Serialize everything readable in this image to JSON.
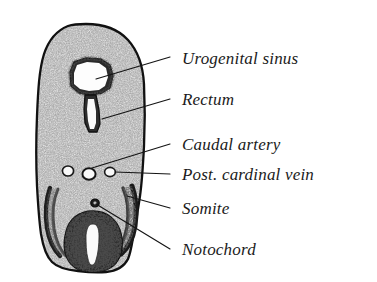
{
  "figure": {
    "kind": "anatomical-cross-section-illustration",
    "background_color": "#ffffff",
    "ink_color": "#141414",
    "tissue_tone": "#8d8d8d",
    "specimen": {
      "outline_name": "body-section-outline",
      "bounds": {
        "x": 37,
        "y": 24,
        "width": 110,
        "height": 248
      }
    },
    "structures": [
      {
        "id": "urogenital-sinus",
        "name": "Urogenital sinus",
        "shape": "irregular-polygon-lumen",
        "center": {
          "x": 88,
          "y": 78
        }
      },
      {
        "id": "rectum",
        "name": "Rectum",
        "shape": "vertical-slit-lumen",
        "center": {
          "x": 92,
          "y": 112
        }
      },
      {
        "id": "caudal-artery",
        "name": "Caudal artery",
        "shape": "small-circle",
        "center": {
          "x": 89,
          "y": 174
        },
        "radius": 6
      },
      {
        "id": "post-cardinal-vein",
        "name": "Post. cardinal vein",
        "shape": "small-circle",
        "center": {
          "x": 110,
          "y": 172
        },
        "radius": 5
      },
      {
        "id": "accessory-vessel-left",
        "name": "unlabeled vessel",
        "shape": "small-circle",
        "center": {
          "x": 68,
          "y": 171
        },
        "radius": 5
      },
      {
        "id": "somite-right",
        "name": "Somite",
        "shape": "curved-band",
        "center": {
          "x": 128,
          "y": 203
        }
      },
      {
        "id": "somite-left",
        "name": "Somite",
        "shape": "curved-band",
        "center": {
          "x": 54,
          "y": 208
        }
      },
      {
        "id": "notochord",
        "name": "Notochord",
        "shape": "small-dark-dot",
        "center": {
          "x": 95,
          "y": 203
        },
        "radius": 3.4
      },
      {
        "id": "neural-tube",
        "name": "neural tube",
        "shape": "oval-with-central-canal",
        "center": {
          "x": 93,
          "y": 238
        }
      }
    ],
    "labels": [
      {
        "id": "urogenital-sinus",
        "text": "Urogenital sinus",
        "text_x": 182,
        "text_y": 64,
        "leader": {
          "x1": 170,
          "y1": 57,
          "x2": 96,
          "y2": 79
        }
      },
      {
        "id": "rectum",
        "text": "Rectum",
        "text_x": 182,
        "text_y": 105,
        "leader": {
          "x1": 170,
          "y1": 99,
          "x2": 102,
          "y2": 119
        }
      },
      {
        "id": "caudal-artery",
        "text": "Caudal artery",
        "text_x": 182,
        "text_y": 150,
        "leader": {
          "x1": 170,
          "y1": 144,
          "x2": 92,
          "y2": 168
        }
      },
      {
        "id": "post-cardinal-vein",
        "text": "Post. cardinal vein",
        "text_x": 182,
        "text_y": 180,
        "leader": {
          "x1": 170,
          "y1": 174,
          "x2": 115,
          "y2": 172
        }
      },
      {
        "id": "somite",
        "text": "Somite",
        "text_x": 182,
        "text_y": 214,
        "leader": {
          "x1": 170,
          "y1": 208,
          "x2": 127,
          "y2": 196
        }
      },
      {
        "id": "notochord",
        "text": "Notochord",
        "text_x": 182,
        "text_y": 255,
        "leader": {
          "x1": 170,
          "y1": 249,
          "x2": 96,
          "y2": 204
        }
      }
    ]
  }
}
